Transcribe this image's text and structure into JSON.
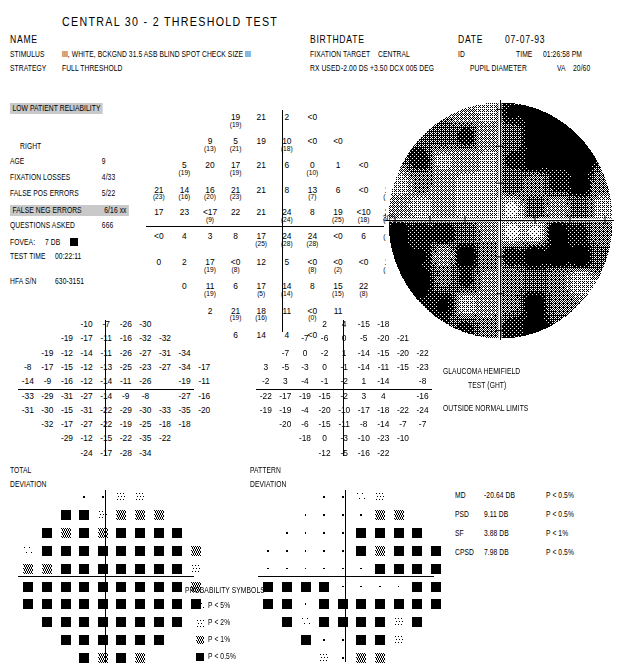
{
  "header": {
    "title": "CENTRAL 30 - 2 THRESHOLD TEST",
    "name_label": "NAME",
    "name_value": "",
    "stimulus_label": "STIMULUS",
    "stimulus_value": "III, WHITE, BCKGND 31.5 ASB  BLIND SPOT CHECK SIZE  III",
    "strategy_label": "STRATEGY",
    "strategy_value": "FULL THRESHOLD",
    "birthdate_label": "BIRTHDATE",
    "birthdate_value": "",
    "fixation_target_label": "FIXATION TARGET",
    "fixation_target_value": "CENTRAL",
    "rx_used_label": "RX USED",
    "rx_used_value": "-2.00 DS +3.50 DCX 005 DEG",
    "date_label": "DATE",
    "date_value": "07-07-93",
    "id_label": "ID",
    "id_value": "",
    "time_label": "TIME",
    "time_value": "01:26:58 PM",
    "pupil_label": "PUPIL DIAMETER",
    "pupil_value": "",
    "va_label": "VA",
    "va_value": "20/60"
  },
  "reliability": {
    "banner": "LOW PATIENT RELIABILITY",
    "eye": "RIGHT",
    "rows": [
      {
        "label": "AGE",
        "value": "9",
        "flag": "",
        "highlight": false
      },
      {
        "label": "FIXATION LOSSES",
        "value": "4/33",
        "flag": "",
        "highlight": false
      },
      {
        "label": "FALSE POS ERRORS",
        "value": "5/22",
        "flag": "",
        "highlight": false
      },
      {
        "label": "FALSE NEG ERRORS",
        "value": "6/16",
        "flag": "xx",
        "highlight": true
      },
      {
        "label": "QUESTIONS ASKED",
        "value": "666",
        "flag": "",
        "highlight": false
      }
    ],
    "fovea_label": "FOVEA:",
    "fovea_value": "7 DB",
    "test_time_label": "TEST TIME",
    "test_time_value": "00:22:11",
    "serial_label": "HFA S/N",
    "serial_value": "630-3151"
  },
  "grayscale": {
    "axis_label_30": "30°"
  },
  "ght": {
    "line1": "GLAUCOMA HEMIFIELD",
    "line2": "TEST (GHT)",
    "result": "OUTSIDE NORMAL LIMITS"
  },
  "indices": [
    {
      "name": "MD",
      "value": "-20.64 DB",
      "p": "P < 0.5%"
    },
    {
      "name": "PSD",
      "value": "9.11 DB",
      "p": "P < 0.5%"
    },
    {
      "name": "SF",
      "value": "3.88 DB",
      "p": "P <  1%"
    },
    {
      "name": "CPSD",
      "value": "7.98 DB",
      "p": "P < 0.5%"
    }
  ],
  "probability_symbols": {
    "title": "PROBABILITY SYMBOLS",
    "items": [
      {
        "level": 1,
        "text": "P <   5%"
      },
      {
        "level": 2,
        "text": "P <   2%"
      },
      {
        "level": 3,
        "text": "P <   1%"
      },
      {
        "level": 4,
        "text": "P < 0.5%"
      }
    ]
  },
  "total_deviation": {
    "label_line1": "TOTAL",
    "label_line2": "DEVIATION"
  },
  "pattern_deviation": {
    "label_line1": "PATTERN",
    "label_line2": "DEVIATION"
  },
  "chart_data": {
    "type": "table",
    "threshold_grid": {
      "description": "Measured sensitivity in dB at each test location. Values in parentheses are retest values. '<0' denotes no response at maximum stimulus.",
      "rows": [
        [
          null,
          null,
          null,
          {
            "v": "19",
            "r": "19"
          },
          {
            "v": "21"
          },
          {
            "v": "2"
          },
          {
            "v": "<0"
          },
          null,
          null,
          null
        ],
        [
          null,
          null,
          {
            "v": "9",
            "r": "13"
          },
          {
            "v": "5",
            "r": "21"
          },
          {
            "v": "19"
          },
          {
            "v": "10",
            "r": "18"
          },
          {
            "v": "<0"
          },
          {
            "v": "<0"
          },
          null,
          null
        ],
        [
          null,
          {
            "v": "5",
            "r": "19"
          },
          {
            "v": "20"
          },
          {
            "v": "17",
            "r": "19"
          },
          {
            "v": "21"
          },
          {
            "v": "6"
          },
          {
            "v": "0",
            "r": "10"
          },
          {
            "v": "1"
          },
          {
            "v": "<0"
          },
          null
        ],
        [
          {
            "v": "21",
            "r": "23"
          },
          {
            "v": "14",
            "r": "16"
          },
          {
            "v": "16",
            "r": "20"
          },
          {
            "v": "21",
            "r": "23"
          },
          {
            "v": "21"
          },
          {
            "v": "8"
          },
          {
            "v": "13",
            "r": "7"
          },
          {
            "v": "6"
          },
          {
            "v": "<0"
          },
          {
            "v": "14",
            "r": "16"
          }
        ],
        [
          {
            "v": "17"
          },
          {
            "v": "23"
          },
          {
            "v": "<17",
            "r": "9"
          },
          {
            "v": "22"
          },
          {
            "v": "21"
          },
          {
            "v": "24",
            "r": "24"
          },
          {
            "v": "8"
          },
          {
            "v": "19",
            "r": "25"
          },
          {
            "v": "<10",
            "r": "18"
          },
          {
            "v": "22",
            "r": "22"
          }
        ],
        [
          {
            "v": "<0"
          },
          {
            "v": "4"
          },
          {
            "v": "3"
          },
          {
            "v": "8"
          },
          {
            "v": "17",
            "r": "25"
          },
          {
            "v": "24",
            "r": "28"
          },
          {
            "v": "24",
            "r": "28"
          },
          {
            "v": "<0"
          },
          {
            "v": "6"
          },
          {
            "v": "",
            "r": "14"
          }
        ],
        [
          {
            "v": "0"
          },
          {
            "v": "2"
          },
          {
            "v": "17",
            "r": "19"
          },
          {
            "v": "<0",
            "r": "8"
          },
          {
            "v": "12"
          },
          {
            "v": "5"
          },
          {
            "v": "<0",
            "r": "8"
          },
          {
            "v": "<0",
            "r": "2"
          },
          {
            "v": "<0"
          },
          {
            "v": "10",
            "r": "16"
          }
        ],
        [
          null,
          {
            "v": "0"
          },
          {
            "v": "11",
            "r": "19"
          },
          {
            "v": "6"
          },
          {
            "v": "17",
            "r": "5"
          },
          {
            "v": "14",
            "r": "14"
          },
          {
            "v": "8"
          },
          {
            "v": "15",
            "r": "15"
          },
          {
            "v": "22",
            "r": "8"
          },
          null
        ],
        [
          null,
          null,
          {
            "v": "2"
          },
          {
            "v": "21",
            "r": "19"
          },
          {
            "v": "18",
            "r": "16"
          },
          {
            "v": "11"
          },
          {
            "v": "<0",
            "r": "0"
          },
          {
            "v": "11"
          },
          null,
          null
        ],
        [
          null,
          null,
          null,
          {
            "v": "6"
          },
          {
            "v": "14"
          },
          {
            "v": "4"
          },
          {
            "v": "<0"
          },
          null,
          null,
          null
        ]
      ]
    },
    "total_deviation_values": {
      "description": "Total deviation from age-matched normals, dB",
      "rows": [
        [
          null,
          null,
          null,
          "-10",
          "-7",
          "-26",
          "-30",
          null,
          null,
          null
        ],
        [
          null,
          null,
          "-19",
          "-17",
          "-11",
          "-16",
          "-32",
          "-32",
          null,
          null
        ],
        [
          null,
          "-19",
          "-12",
          "-14",
          "-11",
          "-26",
          "-27",
          "-31",
          "-34",
          null
        ],
        [
          "-8",
          "-17",
          "-15",
          "-12",
          "-13",
          "-25",
          "-23",
          "-27",
          "-34",
          "-17"
        ],
        [
          "-14",
          "-9",
          "-16",
          "-12",
          "-14",
          "-11",
          "-26",
          "",
          "-19",
          "-11"
        ],
        [
          "-33",
          "-29",
          "-31",
          "-27",
          "-14",
          "-9",
          "-8",
          "",
          "-27",
          "-16"
        ],
        [
          "-31",
          "-30",
          "-15",
          "-31",
          "-22",
          "-29",
          "-30",
          "-33",
          "-35",
          "-20"
        ],
        [
          null,
          "-32",
          "-17",
          "-27",
          "-22",
          "-19",
          "-25",
          "-18",
          "-18",
          null
        ],
        [
          null,
          null,
          "-29",
          "-12",
          "-15",
          "-22",
          "-35",
          "-22",
          null,
          null
        ],
        [
          null,
          null,
          null,
          "-24",
          "-17",
          "-28",
          "-34",
          null,
          null,
          null
        ]
      ]
    },
    "pattern_deviation_values": {
      "description": "Pattern deviation (total deviation corrected for general depression), dB",
      "rows": [
        [
          null,
          null,
          null,
          "2",
          "4",
          "-15",
          "-18",
          null,
          null,
          null
        ],
        [
          null,
          null,
          "-7",
          "-6",
          "0",
          "-5",
          "-20",
          "-21",
          null,
          null
        ],
        [
          null,
          "-7",
          "0",
          "-2",
          "1",
          "-14",
          "-15",
          "-20",
          "-22",
          null
        ],
        [
          "3",
          "-5",
          "-3",
          "0",
          "-1",
          "-14",
          "-11",
          "-15",
          "-23",
          ""
        ],
        [
          "-2",
          "3",
          "-4",
          "-1",
          "-2",
          "1",
          "-14",
          "",
          "-8",
          ""
        ],
        [
          "-22",
          "-17",
          "-19",
          "-15",
          "-2",
          "3",
          "4",
          "",
          "-16",
          ""
        ],
        [
          "-19",
          "-19",
          "-4",
          "-20",
          "-10",
          "-17",
          "-18",
          "-22",
          "-24",
          ""
        ],
        [
          null,
          "-20",
          "-6",
          "-15",
          "-11",
          "-8",
          "-14",
          "-7",
          "-7",
          null
        ],
        [
          null,
          null,
          "-18",
          "0",
          "-3",
          "-10",
          "-23",
          "-10",
          null,
          null
        ],
        [
          null,
          null,
          null,
          "-12",
          "-5",
          "-16",
          "-22",
          null,
          null,
          null
        ]
      ]
    },
    "total_deviation_symbols": {
      "description": "Probability symbol level per location. 0=within normal limits (dot), 1=P<5%, 2=P<2%, 3=P<1%, 4=P<0.5%",
      "rows": [
        [
          null,
          null,
          null,
          0,
          0,
          2,
          2,
          null,
          null,
          null
        ],
        [
          null,
          null,
          4,
          4,
          2,
          3,
          3,
          3,
          null,
          null
        ],
        [
          null,
          4,
          3,
          4,
          3,
          4,
          4,
          4,
          4,
          null
        ],
        [
          1,
          4,
          4,
          4,
          4,
          4,
          4,
          4,
          4,
          3
        ],
        [
          3,
          3,
          4,
          4,
          4,
          4,
          4,
          4,
          4,
          2
        ],
        [
          4,
          4,
          4,
          4,
          4,
          4,
          4,
          4,
          4,
          3
        ],
        [
          4,
          4,
          4,
          4,
          4,
          4,
          4,
          4,
          4,
          4
        ],
        [
          null,
          4,
          4,
          4,
          4,
          4,
          4,
          4,
          4,
          null
        ],
        [
          null,
          null,
          4,
          4,
          4,
          4,
          4,
          4,
          null,
          null
        ],
        [
          null,
          null,
          null,
          4,
          3,
          4,
          3,
          null,
          null,
          null
        ]
      ]
    },
    "pattern_deviation_symbols": {
      "description": "Probability symbol level per location. 0=within normal limits (dot), 1=P<5%, 2=P<2%, 3=P<1%, 4=P<0.5%",
      "rows": [
        [
          null,
          null,
          null,
          0,
          0,
          1,
          2,
          null,
          null,
          null
        ],
        [
          null,
          null,
          0,
          0,
          0,
          0,
          3,
          3,
          null,
          null
        ],
        [
          null,
          0,
          0,
          0,
          0,
          4,
          4,
          4,
          4,
          null
        ],
        [
          0,
          0,
          0,
          0,
          0,
          4,
          3,
          4,
          4,
          4
        ],
        [
          0,
          0,
          0,
          0,
          0,
          0,
          4,
          4,
          4,
          4
        ],
        [
          4,
          4,
          4,
          4,
          0,
          0,
          0,
          0,
          4,
          4
        ],
        [
          4,
          4,
          0,
          4,
          4,
          4,
          4,
          4,
          4,
          4
        ],
        [
          null,
          4,
          1,
          4,
          4,
          4,
          4,
          2,
          4,
          null
        ],
        [
          null,
          null,
          4,
          0,
          0,
          4,
          4,
          2,
          null,
          null
        ],
        [
          null,
          null,
          null,
          2,
          0,
          3,
          3,
          null,
          null,
          null
        ]
      ]
    }
  }
}
